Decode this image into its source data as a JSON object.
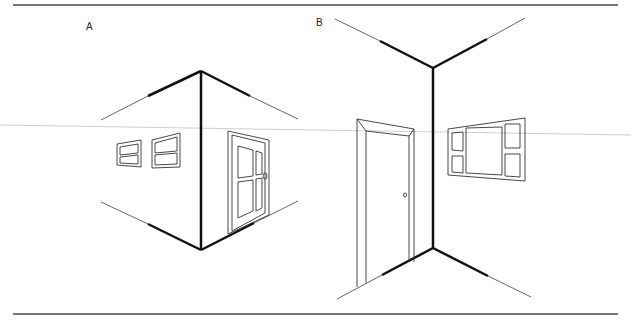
{
  "figure": {
    "panels": [
      {
        "id": "A",
        "label": "A",
        "description": "Two-point perspective exterior corner viewed from outside (corner projecting toward viewer)",
        "elements": [
          "vertical-corner-edge",
          "top-wall-edges",
          "bottom-wall-edges",
          "horizon-line",
          "two-windows-left-wall",
          "paneled-door-right-wall"
        ]
      },
      {
        "id": "B",
        "label": "B",
        "description": "Two-point perspective interior corner viewed from inside a room",
        "elements": [
          "vertical-corner-edge",
          "ceiling-edges",
          "floor-edges",
          "horizon-line",
          "door-left-wall",
          "multi-pane-window-right-wall"
        ]
      }
    ],
    "colors": {
      "thick_line": "#111111",
      "thin_line": "#555555",
      "horizon": "#cccccc",
      "border": "#777777",
      "background": "#ffffff"
    }
  }
}
